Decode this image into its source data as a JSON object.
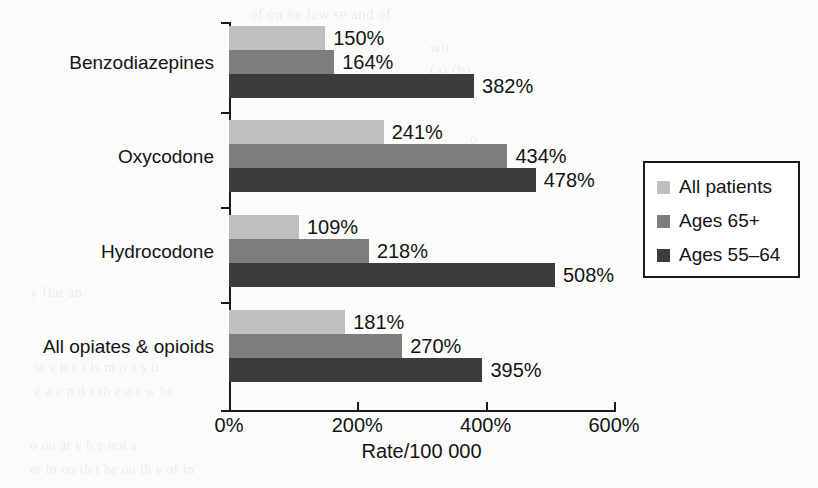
{
  "chart_data": {
    "type": "bar",
    "orientation": "horizontal",
    "title": "",
    "xlabel": "Rate/100 000",
    "ylabel": "",
    "xlim": [
      0,
      600
    ],
    "xticks": [
      "0%",
      "200%",
      "400%",
      "600%"
    ],
    "xtick_values": [
      0,
      200,
      400,
      600
    ],
    "grid": false,
    "legend_position": "right-middle",
    "categories": [
      "Benzodiazepines",
      "Oxycodone",
      "Hydrocodone",
      "All opiates & opioids"
    ],
    "series": [
      {
        "name": "All patients",
        "color": "#bfbfbf",
        "values": [
          150,
          241,
          109,
          181
        ],
        "labels": [
          "150%",
          "241%",
          "109%",
          "181%"
        ]
      },
      {
        "name": "Ages 65+",
        "color": "#7d7d7d",
        "values": [
          164,
          434,
          218,
          270
        ],
        "labels": [
          "164%",
          "434%",
          "218%",
          "270%"
        ]
      },
      {
        "name": "Ages 55–64",
        "color": "#3c3c3c",
        "values": [
          382,
          478,
          508,
          395
        ],
        "labels": [
          "382%",
          "478%",
          "508%",
          "395%"
        ]
      }
    ]
  },
  "legend": {
    "items": [
      {
        "label": "All patients",
        "color": "#bfbfbf"
      },
      {
        "label": "Ages 65+",
        "color": "#7d7d7d"
      },
      {
        "label": "Ages 55–64",
        "color": "#3c3c3c"
      }
    ]
  },
  "axis": {
    "x_title": "Rate/100 000",
    "tick_labels": [
      "0%",
      "200%",
      "400%",
      "600%"
    ]
  },
  "bleed_through": [
    {
      "text": "of on he law  se  and of",
      "x": 250,
      "y": 6,
      "size": 15
    },
    {
      "text": "wit",
      "x": 430,
      "y": 40,
      "size": 15
    },
    {
      "text": "(a)   (b)",
      "x": 430,
      "y": 62,
      "size": 15
    },
    {
      "text": "o",
      "x": 470,
      "y": 130,
      "size": 15
    },
    {
      "text": "y flat  an",
      "x": 30,
      "y": 284,
      "size": 15
    },
    {
      "text": "w  a   h  e  i  is  m  o  a  s   li",
      "x": 35,
      "y": 360,
      "size": 14
    },
    {
      "text": "c  a  e  n  d  s  th  e  o  r  w   be",
      "x": 35,
      "y": 384,
      "size": 14
    },
    {
      "text": "o    ou  ar  e  h  e   not   a",
      "x": 30,
      "y": 438,
      "size": 14
    },
    {
      "text": "er  in    ou   th  t  be  ou  th  e  of  in",
      "x": 30,
      "y": 462,
      "size": 14
    }
  ]
}
